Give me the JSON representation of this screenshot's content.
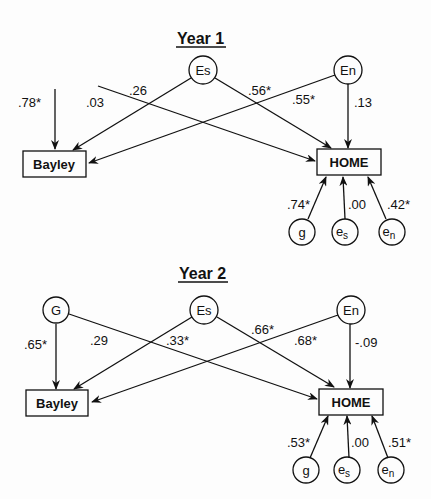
{
  "panels": [
    {
      "title": "Year 1",
      "nodes": {
        "es": "Es",
        "en": "En",
        "bayley": "Bayley",
        "home": "HOME",
        "g": "g",
        "e_s": "e",
        "e_s_sub": "s",
        "e_n": "e",
        "e_n_sub": "n"
      },
      "paths": {
        "g_bayley": ".78*",
        "g_home": ".03",
        "es_bayley": ".26",
        "es_home": ".56*",
        "en_bayley": ".55*",
        "en_home": ".13",
        "g_res_home": ".74*",
        "es_res_home": ".00",
        "en_res_home": ".42*"
      }
    },
    {
      "title": "Year 2",
      "nodes": {
        "G": "G",
        "es": "Es",
        "en": "En",
        "bayley": "Bayley",
        "home": "HOME",
        "g": "g",
        "e_s": "e",
        "e_s_sub": "s",
        "e_n": "e",
        "e_n_sub": "n"
      },
      "paths": {
        "g_bayley": ".65*",
        "g_home": ".29",
        "es_bayley": ".33*",
        "es_home": ".66*",
        "en_bayley": ".68*",
        "en_home": "-.09",
        "g_res_home": ".53*",
        "es_res_home": ".00",
        "en_res_home": ".51*"
      }
    }
  ]
}
